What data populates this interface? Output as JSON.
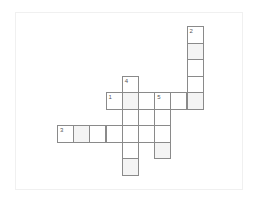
{
  "puzzle": {
    "type": "crossword",
    "grid": {
      "origin_x": 57,
      "origin_y": 26,
      "cell_w": 16.2,
      "cell_h": 16.5,
      "cells": [
        {
          "r": 0,
          "c": 8,
          "num": "2",
          "shaded": false
        },
        {
          "r": 1,
          "c": 8,
          "shaded": true
        },
        {
          "r": 2,
          "c": 8,
          "shaded": false
        },
        {
          "r": 3,
          "c": 8,
          "shaded": false
        },
        {
          "r": 3,
          "c": 4,
          "num": "4",
          "shaded": false
        },
        {
          "r": 4,
          "c": 3,
          "num": "1",
          "shaded": false
        },
        {
          "r": 4,
          "c": 4,
          "shaded": true
        },
        {
          "r": 4,
          "c": 5,
          "shaded": false
        },
        {
          "r": 4,
          "c": 6,
          "num": "5",
          "shaded": false
        },
        {
          "r": 4,
          "c": 7,
          "shaded": false
        },
        {
          "r": 4,
          "c": 8,
          "shaded": true
        },
        {
          "r": 5,
          "c": 4,
          "shaded": false
        },
        {
          "r": 5,
          "c": 5,
          "shaded": false
        },
        {
          "r": 5,
          "c": 6,
          "shaded": false
        },
        {
          "r": 6,
          "c": 0,
          "num": "3",
          "shaded": false
        },
        {
          "r": 6,
          "c": 1,
          "shaded": true
        },
        {
          "r": 6,
          "c": 2,
          "shaded": false
        },
        {
          "r": 6,
          "c": 3,
          "shaded": false
        },
        {
          "r": 6,
          "c": 4,
          "shaded": false
        },
        {
          "r": 6,
          "c": 5,
          "shaded": false
        },
        {
          "r": 6,
          "c": 6,
          "shaded": false
        },
        {
          "r": 7,
          "c": 4,
          "shaded": false
        },
        {
          "r": 7,
          "c": 6,
          "shaded": true
        },
        {
          "r": 8,
          "c": 4,
          "shaded": true
        }
      ]
    },
    "clues": {
      "across": [
        {
          "num": "1"
        },
        {
          "num": "3"
        }
      ],
      "down": [
        {
          "num": "2"
        },
        {
          "num": "4"
        },
        {
          "num": "5"
        }
      ]
    }
  }
}
